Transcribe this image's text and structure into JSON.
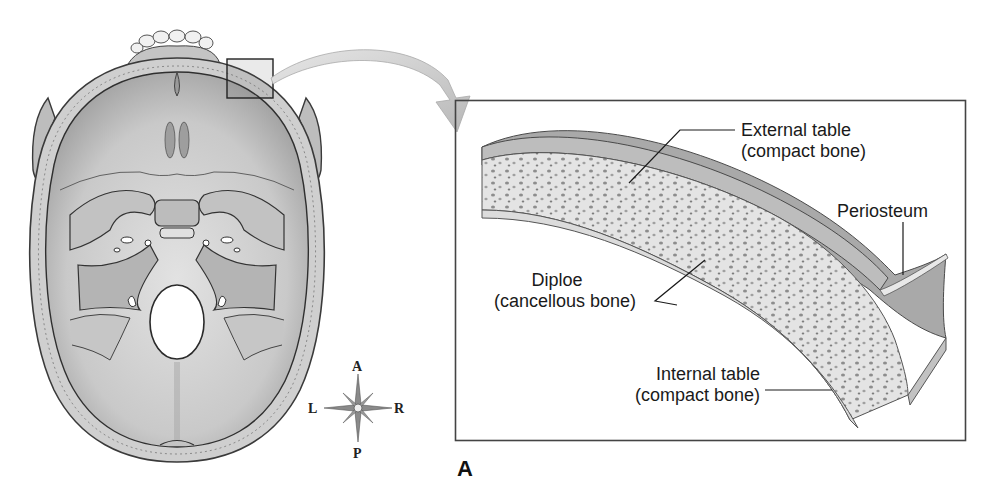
{
  "figure": {
    "panel_letter": "A",
    "skull_view": "superior view of cranial floor (cranial base) with calvaria removed",
    "inset_highlight": "small square on frontal bone near midline",
    "arrow": "curved arrow from highlighted square to enlarged inset"
  },
  "labels": {
    "external_table": {
      "line1": "External table",
      "line2": "(compact bone)"
    },
    "periosteum": {
      "line1": "Periosteum"
    },
    "diploe": {
      "line1": "Diploe",
      "line2": "(cancellous bone)"
    },
    "internal_table": {
      "line1": "Internal table",
      "line2": "(compact bone)"
    }
  },
  "compass": {
    "anterior": "A",
    "posterior": "P",
    "left": "L",
    "right": "R"
  },
  "colors": {
    "bone_light": "#d9d9d9",
    "bone_mid": "#b3b3b3",
    "bone_dark": "#8a8a8a",
    "outline": "#3a3a3a",
    "arrow_fill": "#c8c8c8",
    "frame": "#444444"
  }
}
